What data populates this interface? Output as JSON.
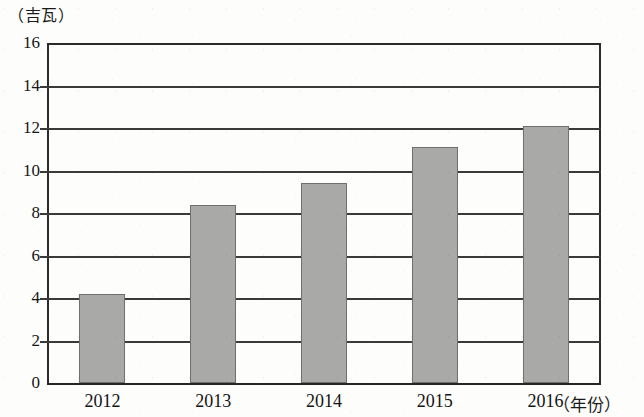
{
  "chart_data": {
    "type": "bar",
    "title": "",
    "subtitle": "",
    "xlabel": "（年份）",
    "ylabel": "（吉瓦）",
    "categories": [
      "2012",
      "2013",
      "2014",
      "2015",
      "2016"
    ],
    "values": [
      4.2,
      8.4,
      9.4,
      11.1,
      12.1
    ],
    "series": [
      {
        "name": "装机容量",
        "values": [
          4.2,
          8.4,
          9.4,
          11.1,
          12.1
        ]
      }
    ],
    "ylim": [
      0,
      16
    ],
    "ytick_step": 2,
    "yticks": [
      "16",
      "14",
      "12",
      "10",
      "8",
      "6",
      "4",
      "2",
      "0"
    ],
    "ytick_values": [
      16,
      14,
      12,
      10,
      8,
      6,
      4,
      2,
      0
    ],
    "xlim_categories": 5,
    "grid": true,
    "grid_axis": "y",
    "legend": false,
    "legend_position": "none",
    "bar_color": "#a9a9a7",
    "bar_edge_color": "#6f6f6d",
    "axis_color": "#2b2b2b",
    "background_color": "#fdfdfc",
    "data_labels": false,
    "annotations": []
  }
}
